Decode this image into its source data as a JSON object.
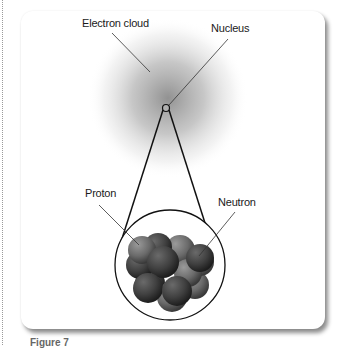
{
  "figure": {
    "labels": {
      "electron_cloud": "Electron cloud",
      "nucleus": "Nucleus",
      "proton": "Proton",
      "neutron": "Neutron"
    },
    "caption": "Figure 7"
  },
  "colors": {
    "cloud_center": "#9a9a9a",
    "proton": "#6e6e6e",
    "neutron": "#3f3f3f",
    "outline": "#111111"
  }
}
